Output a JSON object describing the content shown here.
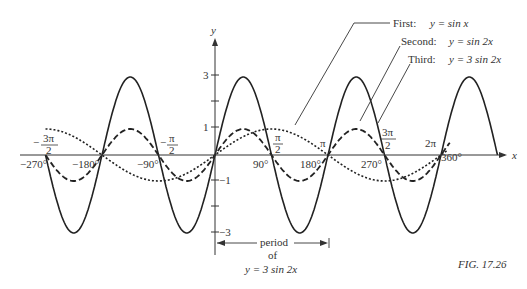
{
  "chart_data": {
    "type": "line",
    "title": "",
    "xlabel": "x",
    "ylabel": "y",
    "xlim_degrees": [
      -280,
      380
    ],
    "ylim": [
      -3.5,
      4
    ],
    "grid": false,
    "legend_position": "top-right (callout labels with leader lines)",
    "x_tick_labels_degrees": [
      "-270°",
      "-180°",
      "-90°",
      "90°",
      "180°",
      "270°",
      "360°"
    ],
    "x_tick_labels_radians": [
      "-3π/2",
      "-π/2",
      "π/2",
      "π",
      "3π/2",
      "2π"
    ],
    "y_tick_labels": [
      "3",
      "1",
      "-1",
      "-3"
    ],
    "series": [
      {
        "name": "First",
        "equation": "y = sin x",
        "style": "dotted",
        "amplitude": 1,
        "period_degrees": 360
      },
      {
        "name": "Second",
        "equation": "y = sin 2x",
        "style": "dashed",
        "amplitude": 1,
        "period_degrees": 180
      },
      {
        "name": "Third",
        "equation": "y = 3 sin 2x",
        "style": "solid",
        "amplitude": 3,
        "period_degrees": 180
      }
    ],
    "annotations": [
      {
        "text": "period of y = 3 sin 2x",
        "spans_degrees": [
          0,
          180
        ]
      }
    ],
    "figure_label": "FIG. 17.26"
  },
  "axis": {
    "x_label": "x",
    "y_label": "y"
  },
  "ticks": {
    "y": [
      {
        "label": "3",
        "value": 3
      },
      {
        "label": "1",
        "value": 1
      },
      {
        "label": "−1",
        "value": -1
      },
      {
        "label": "−3",
        "value": -3
      }
    ],
    "x_deg": [
      {
        "label": "−270°",
        "value": -270
      },
      {
        "label": "−180°",
        "value": -180
      },
      {
        "label": "−90°",
        "value": -90
      },
      {
        "label": "90°",
        "value": 90
      },
      {
        "label": "180°",
        "value": 180
      },
      {
        "label": "270°",
        "value": 270
      },
      {
        "label": "360°",
        "value": 360
      }
    ]
  },
  "legend": {
    "first": {
      "name": "First:",
      "eq": "y  =  sin x"
    },
    "second": {
      "name": "Second:",
      "eq": "y  =  sin 2x"
    },
    "third": {
      "name": "Third:",
      "eq": "y  =  3 sin 2x"
    }
  },
  "radians": {
    "neg3pi2_num": "3π",
    "neg3pi2_den": "2",
    "neg_sign": "−",
    "negpi2_num": "π",
    "negpi2_den": "2",
    "pi2_num": "π",
    "pi2_den": "2",
    "pi": "π",
    "threepi2_num": "3π",
    "threepi2_den": "2",
    "twopi": "2π"
  },
  "period": {
    "line1": "period",
    "line2": "of",
    "line3": "y  =  3 sin 2x"
  },
  "figure_label": "FIG. 17.26"
}
